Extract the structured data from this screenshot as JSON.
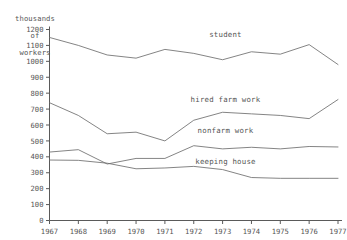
{
  "chart_data": {
    "type": "line",
    "title": "",
    "subtitle": "",
    "ylabel": "thousands\nof\nworkers",
    "xlabel": "",
    "grid": false,
    "legend_position": "inline-right",
    "x": [
      1967,
      1968,
      1969,
      1970,
      1971,
      1972,
      1973,
      1974,
      1975,
      1976,
      1977
    ],
    "xtick_labels": [
      "1967",
      "1968",
      "1969",
      "1970",
      "1971",
      "1972",
      "1973",
      "1974",
      "1975",
      "1976",
      "1977"
    ],
    "ytick_labels": [
      "0",
      "100",
      "200",
      "300",
      "400",
      "500",
      "600",
      "700",
      "800",
      "900",
      "1000",
      "1100",
      "1200"
    ],
    "ytick_values": [
      0,
      100,
      200,
      300,
      400,
      500,
      600,
      700,
      800,
      900,
      1000,
      1100,
      1200
    ],
    "ylim": [
      0,
      1200
    ],
    "xlim": [
      1967,
      1977
    ],
    "series": [
      {
        "name": "student",
        "label": "student",
        "label_x": 1973.1,
        "label_y": 1155,
        "color": "#6e6e6e",
        "values": [
          1150,
          1100,
          1040,
          1020,
          1075,
          1050,
          1010,
          1060,
          1045,
          1105,
          980
        ]
      },
      {
        "name": "hired farm work",
        "label": "hired farm work",
        "label_x": 1973.1,
        "label_y": 745,
        "color": "#6e6e6e",
        "values": [
          740,
          660,
          545,
          555,
          500,
          630,
          680,
          670,
          660,
          640,
          760
        ]
      },
      {
        "name": "nonfarm work",
        "label": "nonfarm work",
        "label_x": 1973.1,
        "label_y": 548,
        "color": "#6e6e6e",
        "values": [
          430,
          445,
          355,
          390,
          390,
          470,
          450,
          460,
          450,
          465,
          462
        ]
      },
      {
        "name": "keeping house",
        "label": "keeping house",
        "label_x": 1973.1,
        "label_y": 352,
        "color": "#6e6e6e",
        "values": [
          380,
          378,
          360,
          325,
          330,
          340,
          320,
          270,
          265,
          265,
          265
        ]
      }
    ]
  },
  "axis": {
    "y_title_line1": "thousands",
    "y_title_line2": "of",
    "y_title_line3": "workers"
  }
}
